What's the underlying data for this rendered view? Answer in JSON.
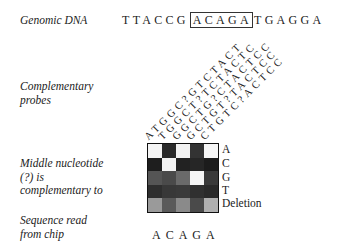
{
  "labels": {
    "genomic_dna": "Genomic DNA",
    "probes_line1": "Complementary",
    "probes_line2": "probes",
    "middle_line1": "Middle nucleotide",
    "middle_line2": "(?) is",
    "middle_line3": "complementary to",
    "read_line1": "Sequence read",
    "read_line2": "from chip"
  },
  "genomic": {
    "prefix": "TTACCG",
    "highlight": "ACAGA",
    "suffix": "TGAGGA"
  },
  "probes": [
    "ATGGC?GTCTACT",
    "TGGCT?TCTACTC",
    "GGCTG?CTACTCC",
    "GCTGT?TACTCC",
    "CTGTC?ACTCC"
  ],
  "row_labels": [
    "A",
    "C",
    "G",
    "T",
    "Deletion"
  ],
  "grid_intensity": [
    [
      "#f4f4f4",
      "#2a2a2a",
      "#f2f2f2",
      "#333333",
      "#f6f6f6"
    ],
    [
      "#1e1e1e",
      "#f3f3f3",
      "#222222",
      "#262626",
      "#1c1c1c"
    ],
    [
      "#555555",
      "#4a4a4a",
      "#6a6a6a",
      "#f5f5f5",
      "#3a3a3a"
    ],
    [
      "#2e2e2e",
      "#383838",
      "#3a3a3a",
      "#303030",
      "#2a2a2a"
    ],
    [
      "#9a9a9a",
      "#5a5a5a",
      "#8a8a8a",
      "#4a4a4a",
      "#b0b0b0"
    ]
  ],
  "sequence_read": "ACAGA"
}
